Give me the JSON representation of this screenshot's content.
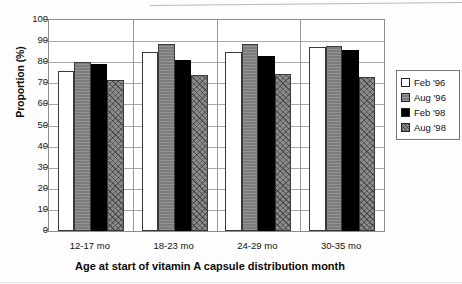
{
  "chart_data": {
    "type": "bar",
    "title": "",
    "xlabel": "Age at start of vitamin A capsule distribution month",
    "ylabel": "Proportion (%)",
    "ylim": [
      0,
      100
    ],
    "ytick_step": 10,
    "yticks": [
      0,
      10,
      20,
      30,
      40,
      50,
      60,
      70,
      80,
      90,
      100
    ],
    "grid": true,
    "legend_position": "right",
    "categories": [
      "12-17 mo",
      "18-23 mo",
      "24-29 mo",
      "30-35 mo"
    ],
    "series": [
      {
        "name": "Feb '96",
        "color": "#ffffff",
        "values": [
          76,
          85,
          85,
          87
        ]
      },
      {
        "name": "Aug '96",
        "color": "#7d7d7d",
        "values": [
          80,
          88.5,
          88.5,
          87.5
        ]
      },
      {
        "name": "Feb '98",
        "color": "#000000",
        "values": [
          79,
          81,
          83,
          86
        ]
      },
      {
        "name": "Aug '98",
        "color": "#8a8a8a",
        "values": [
          71.5,
          74,
          74.5,
          73
        ]
      }
    ]
  },
  "legend": {
    "items": [
      {
        "label": "Feb '96"
      },
      {
        "label": "Aug '96"
      },
      {
        "label": "Feb '98"
      },
      {
        "label": "Aug '98"
      }
    ]
  }
}
